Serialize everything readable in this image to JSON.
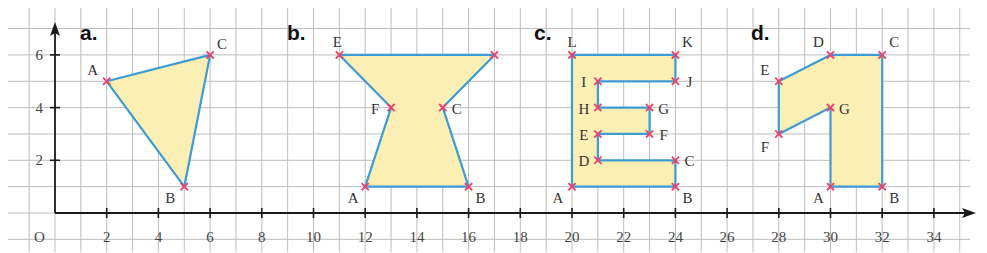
{
  "figure": {
    "origin_label": "O",
    "x_ticks": [
      2,
      4,
      6,
      8,
      10,
      12,
      14,
      16,
      18,
      20,
      22,
      24,
      26,
      28,
      30,
      32,
      34
    ],
    "y_ticks": [
      2,
      4,
      6
    ],
    "x_range": [
      0,
      35
    ],
    "y_range": [
      -1,
      7
    ],
    "grid": true,
    "colors": {
      "grid": "#bdbdbd",
      "axis": "#1a1a1a",
      "edge": "#3d9bd6",
      "fill": "#fcefb4",
      "marker": "#e8436b"
    }
  },
  "chart_data": {
    "type": "diagram",
    "title": "",
    "xlabel": "",
    "ylabel": "",
    "xlim": [
      0,
      35
    ],
    "ylim": [
      -1,
      7
    ],
    "grid": true,
    "shapes": [
      {
        "panel": "a.",
        "points": [
          {
            "label": "A",
            "x": 2,
            "y": 5
          },
          {
            "label": "B",
            "x": 5,
            "y": 1
          },
          {
            "label": "C",
            "x": 6,
            "y": 6
          }
        ]
      },
      {
        "panel": "b.",
        "points": [
          {
            "label": "A",
            "x": 12,
            "y": 1
          },
          {
            "label": "B",
            "x": 16,
            "y": 1
          },
          {
            "label": "C",
            "x": 15,
            "y": 4
          },
          {
            "label": "",
            "x": 17,
            "y": 6
          },
          {
            "label": "E",
            "x": 11,
            "y": 6
          },
          {
            "label": "F",
            "x": 13,
            "y": 4
          }
        ]
      },
      {
        "panel": "c.",
        "points": [
          {
            "label": "A",
            "x": 20,
            "y": 1
          },
          {
            "label": "B",
            "x": 24,
            "y": 1
          },
          {
            "label": "C",
            "x": 24,
            "y": 2
          },
          {
            "label": "D",
            "x": 21,
            "y": 2
          },
          {
            "label": "E",
            "x": 21,
            "y": 3
          },
          {
            "label": "F",
            "x": 23,
            "y": 3
          },
          {
            "label": "G",
            "x": 23,
            "y": 4
          },
          {
            "label": "H",
            "x": 21,
            "y": 4
          },
          {
            "label": "I",
            "x": 21,
            "y": 5
          },
          {
            "label": "J",
            "x": 24,
            "y": 5
          },
          {
            "label": "K",
            "x": 24,
            "y": 6
          },
          {
            "label": "L",
            "x": 20,
            "y": 6
          }
        ]
      },
      {
        "panel": "d.",
        "points": [
          {
            "label": "A",
            "x": 30,
            "y": 1
          },
          {
            "label": "B",
            "x": 32,
            "y": 1
          },
          {
            "label": "C",
            "x": 32,
            "y": 6
          },
          {
            "label": "D",
            "x": 30,
            "y": 6
          },
          {
            "label": "E",
            "x": 28,
            "y": 5
          },
          {
            "label": "F",
            "x": 28,
            "y": 3
          },
          {
            "label": "G",
            "x": 30,
            "y": 4
          }
        ]
      }
    ]
  }
}
